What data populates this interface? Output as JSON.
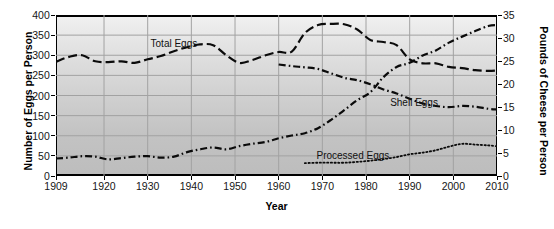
{
  "chart_data": {
    "type": "line",
    "title": "",
    "xlabel": "Year",
    "ylabel": "Number of Eggs per Person",
    "y2label": "Pounds of Cheese per Person",
    "xlim": [
      1909,
      2010
    ],
    "ylim": [
      0,
      400
    ],
    "y2lim": [
      0,
      35
    ],
    "grid": true,
    "legend_position": "inline-annotations",
    "xticks": [
      "1909",
      "1920",
      "1930",
      "1940",
      "1950",
      "1960",
      "1970",
      "1980",
      "1990",
      "2000",
      "2010"
    ],
    "xtick_values": [
      1909,
      1920,
      1930,
      1940,
      1950,
      1960,
      1970,
      1980,
      1990,
      2000,
      2010
    ],
    "yticks": [
      "0",
      "50",
      "100",
      "150",
      "200",
      "250",
      "300",
      "350",
      "400"
    ],
    "ytick_values": [
      0,
      50,
      100,
      150,
      200,
      250,
      300,
      350,
      400
    ],
    "y2ticks": [
      "0",
      "5",
      "10",
      "15",
      "20",
      "25",
      "30",
      "35"
    ],
    "y2tick_values": [
      0,
      5,
      10,
      15,
      20,
      25,
      30,
      35
    ],
    "series": [
      {
        "name": "Total Eggs",
        "axis": "left",
        "unit": "eggs per person",
        "dash": "long-dash",
        "label_x": 1936,
        "label_y": 330,
        "x": [
          1909,
          1912,
          1915,
          1918,
          1921,
          1924,
          1927,
          1930,
          1933,
          1936,
          1939,
          1942,
          1945,
          1948,
          1951,
          1954,
          1957,
          1960,
          1963,
          1966,
          1969,
          1972,
          1975,
          1978,
          1981,
          1984,
          1987,
          1990,
          1993,
          1996,
          1999,
          2002,
          2005,
          2008,
          2010
        ],
        "values": [
          284,
          296,
          300,
          285,
          283,
          285,
          281,
          290,
          298,
          310,
          320,
          327,
          325,
          300,
          281,
          288,
          300,
          308,
          309,
          355,
          375,
          378,
          377,
          364,
          338,
          333,
          325,
          290,
          280,
          280,
          271,
          268,
          263,
          261,
          262
        ]
      },
      {
        "name": "Shell Eggs",
        "axis": "left",
        "unit": "eggs per person",
        "dash": "dash-dot",
        "label_x": 1991,
        "label_y": 185,
        "x": [
          1960,
          1963,
          1966,
          1969,
          1972,
          1975,
          1978,
          1981,
          1984,
          1987,
          1990,
          1993,
          1996,
          1999,
          2002,
          2005,
          2008,
          2010
        ],
        "values": [
          277,
          273,
          270,
          266,
          255,
          244,
          238,
          228,
          215,
          205,
          192,
          180,
          174,
          171,
          174,
          172,
          167,
          165
        ]
      },
      {
        "name": "Total Cheese",
        "axis": "right",
        "unit": "pounds per person",
        "dash": "dash-dot",
        "label_x": 1931,
        "label_y": 66,
        "x": [
          1909,
          1912,
          1915,
          1918,
          1921,
          1924,
          1927,
          1930,
          1933,
          1936,
          1939,
          1942,
          1945,
          1948,
          1951,
          1954,
          1957,
          1960,
          1963,
          1966,
          1969,
          1972,
          1975,
          1978,
          1981,
          1984,
          1987,
          1990,
          1993,
          1996,
          1999,
          2002,
          2005,
          2008,
          2010
        ],
        "values": [
          3.8,
          4.0,
          4.3,
          4.2,
          3.6,
          3.9,
          4.2,
          4.3,
          4.0,
          4.2,
          5.2,
          5.8,
          6.2,
          5.8,
          6.5,
          7.0,
          7.4,
          8.2,
          8.8,
          9.3,
          10.4,
          12.2,
          14.3,
          16.5,
          18.2,
          21.5,
          23.7,
          24.6,
          26.2,
          27.3,
          29.0,
          30.3,
          31.5,
          32.6,
          32.8
        ]
      },
      {
        "name": "Processed Eggs",
        "axis": "left",
        "unit": "eggs per person",
        "dash": "dotted",
        "label_x": 1977,
        "label_y": 52,
        "x": [
          1966,
          1969,
          1972,
          1975,
          1978,
          1981,
          1984,
          1987,
          1990,
          1993,
          1996,
          1999,
          2002,
          2005,
          2008,
          2010
        ],
        "values": [
          32,
          33,
          33,
          33,
          35,
          38,
          42,
          47,
          54,
          58,
          64,
          73,
          80,
          78,
          76,
          74
        ]
      }
    ]
  },
  "axes": {
    "left_title": "Number of Eggs per Person",
    "right_title": "Pounds of Cheese per Person",
    "x_title": "Year"
  }
}
